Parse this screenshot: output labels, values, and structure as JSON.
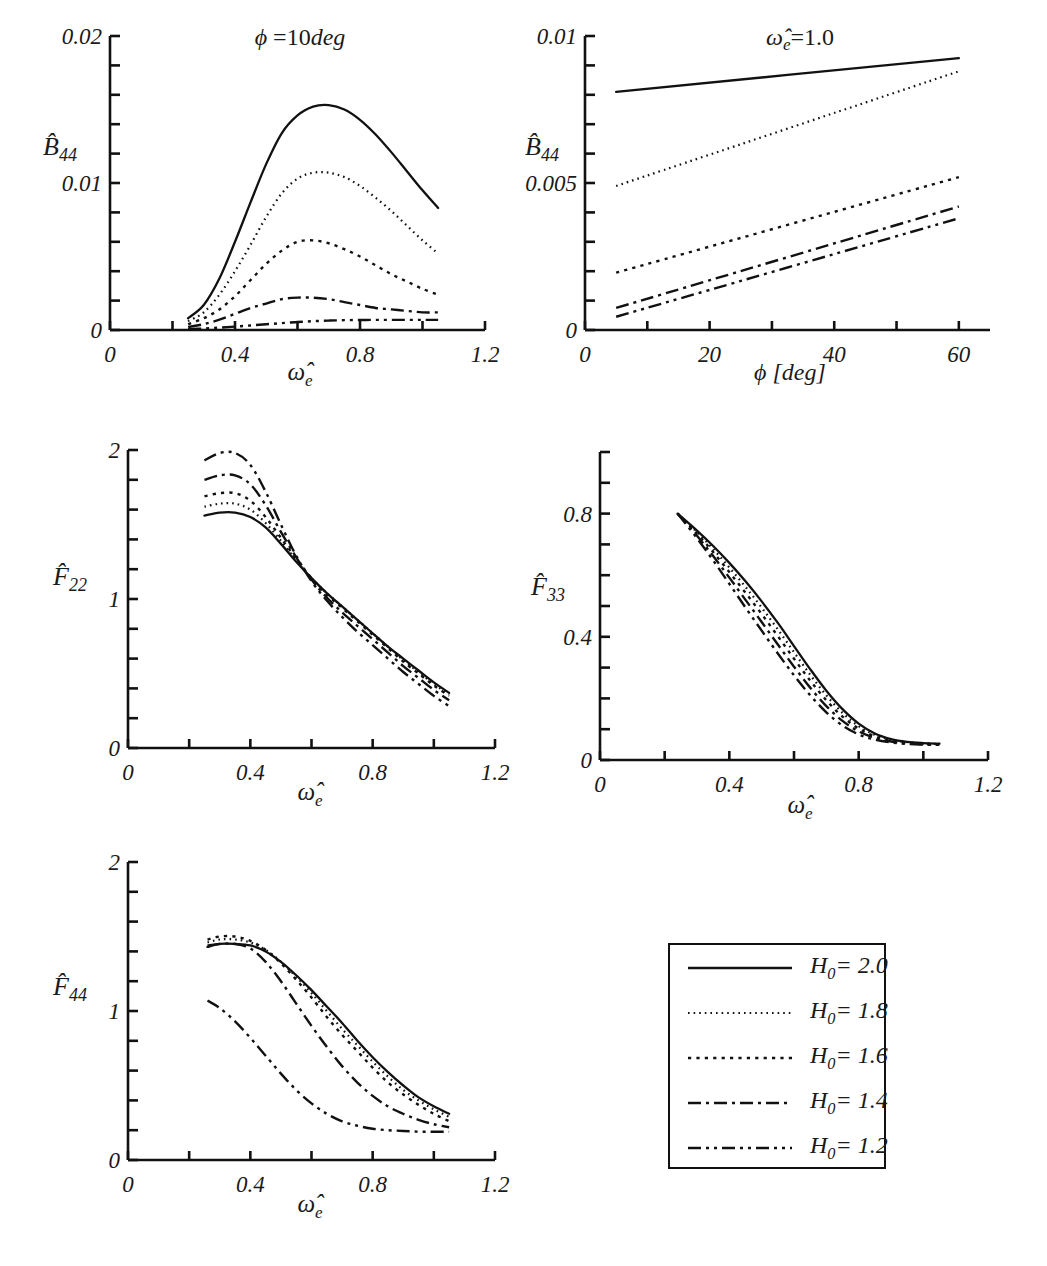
{
  "figure": {
    "background": "#ffffff",
    "line_color": "#111111"
  },
  "legend": {
    "name": "series-legend",
    "entries": [
      {
        "label": "H0= 2.0",
        "style": "solid",
        "value": 2.0
      },
      {
        "label": "H0= 1.8",
        "style": "dotted-fine",
        "value": 1.8
      },
      {
        "label": "H0= 1.6",
        "style": "dotted-coarse",
        "value": 1.6
      },
      {
        "label": "H0= 1.4",
        "style": "dash-dot",
        "value": 1.4
      },
      {
        "label": "H0= 1.2",
        "style": "dash-dot-dot",
        "value": 1.2
      }
    ]
  },
  "chart_data": [
    {
      "id": "plot-b44-vs-omega",
      "type": "line",
      "title": "ϕ =10deg",
      "xlabel": "ω̂e",
      "ylabel": "B̂44",
      "xlim": [
        0,
        1.2
      ],
      "ylim": [
        0,
        0.02
      ],
      "xticks": [
        0,
        0.4,
        0.8,
        1.2
      ],
      "xticklabels": [
        "0",
        "0.4",
        "0.8",
        "1.2"
      ],
      "yticks": [
        0,
        0.01,
        0.02
      ],
      "yticklabels": [
        "0",
        "0.01",
        "0.02"
      ],
      "grid": false,
      "x": [
        0.25,
        0.3,
        0.35,
        0.4,
        0.45,
        0.5,
        0.55,
        0.6,
        0.65,
        0.7,
        0.75,
        0.8,
        0.85,
        0.9,
        0.95,
        1.0,
        1.05
      ],
      "series": [
        {
          "name": "H0= 2.0",
          "style": "solid",
          "values": [
            0.0008,
            0.0017,
            0.0035,
            0.006,
            0.0087,
            0.0113,
            0.0134,
            0.0146,
            0.0152,
            0.0153,
            0.015,
            0.0143,
            0.0133,
            0.0121,
            0.0108,
            0.0095,
            0.0083
          ]
        },
        {
          "name": "H0= 1.8",
          "style": "dotted-fine",
          "values": [
            0.0006,
            0.0012,
            0.0024,
            0.004,
            0.0058,
            0.0077,
            0.0093,
            0.0103,
            0.0107,
            0.0107,
            0.0104,
            0.0098,
            0.009,
            0.0081,
            0.0071,
            0.0061,
            0.0052
          ]
        },
        {
          "name": "H0= 1.6",
          "style": "dotted-coarse",
          "values": [
            0.0004,
            0.0008,
            0.0014,
            0.0023,
            0.0034,
            0.0045,
            0.0054,
            0.006,
            0.0061,
            0.0059,
            0.0055,
            0.005,
            0.0044,
            0.0038,
            0.0033,
            0.0028,
            0.0024
          ]
        },
        {
          "name": "H0= 1.4",
          "style": "dash-dot",
          "values": [
            0.0002,
            0.0004,
            0.0007,
            0.0011,
            0.0015,
            0.0018,
            0.0021,
            0.0022,
            0.0022,
            0.0021,
            0.0019,
            0.0017,
            0.0015,
            0.0014,
            0.0013,
            0.0012,
            0.0012
          ]
        },
        {
          "name": "H0= 1.2",
          "style": "dash-dot-dot",
          "values": [
            5e-05,
            0.0001,
            0.00016,
            0.00023,
            0.00031,
            0.00039,
            0.00047,
            0.00054,
            0.0006,
            0.00064,
            0.00067,
            0.00068,
            0.00069,
            0.00069,
            0.00069,
            0.00069,
            0.00069
          ]
        }
      ]
    },
    {
      "id": "plot-b44-vs-phi",
      "type": "line",
      "title": "ω̂e=1.0",
      "xlabel": "ϕ [deg]",
      "ylabel": "B̂44",
      "xlim": [
        0,
        65
      ],
      "ylim": [
        0,
        0.01
      ],
      "xticks": [
        0,
        10,
        20,
        30,
        40,
        50,
        60
      ],
      "xticklabels": [
        "0",
        "",
        "20",
        "",
        "40",
        "",
        "60"
      ],
      "yticks": [
        0,
        0.005,
        0.01
      ],
      "yticklabels": [
        "0",
        "0.005",
        "0.01"
      ],
      "grid": false,
      "x": [
        5,
        60
      ],
      "series": [
        {
          "name": "H0= 2.0",
          "style": "solid",
          "values": [
            0.0081,
            0.00925
          ]
        },
        {
          "name": "H0= 1.8",
          "style": "dotted-fine",
          "values": [
            0.0049,
            0.0088
          ]
        },
        {
          "name": "H0= 1.6",
          "style": "dotted-coarse",
          "values": [
            0.00195,
            0.0052
          ]
        },
        {
          "name": "H0= 1.4",
          "style": "dash-dot",
          "values": [
            0.00075,
            0.0042
          ]
        },
        {
          "name": "H0= 1.2",
          "style": "dash-dot-dot",
          "values": [
            0.00045,
            0.0038
          ]
        }
      ]
    },
    {
      "id": "plot-f22",
      "type": "line",
      "title": "",
      "xlabel": "ω̂e",
      "ylabel": "F̂22",
      "xlim": [
        0,
        1.2
      ],
      "ylim": [
        0,
        2
      ],
      "xticks": [
        0,
        0.4,
        0.8,
        1.2
      ],
      "xticklabels": [
        "0",
        "0.4",
        "0.8",
        "1.2"
      ],
      "yticks": [
        0,
        1,
        2
      ],
      "yticklabels": [
        "0",
        "1",
        "2"
      ],
      "grid": false,
      "x": [
        0.25,
        0.3,
        0.35,
        0.4,
        0.45,
        0.5,
        0.55,
        0.6,
        0.65,
        0.7,
        0.75,
        0.8,
        0.85,
        0.9,
        0.95,
        1.0,
        1.05
      ],
      "series": [
        {
          "name": "H0= 2.0",
          "style": "solid",
          "values": [
            1.56,
            1.58,
            1.58,
            1.55,
            1.48,
            1.37,
            1.25,
            1.14,
            1.04,
            0.95,
            0.86,
            0.77,
            0.68,
            0.6,
            0.52,
            0.44,
            0.37
          ]
        },
        {
          "name": "H0= 1.8",
          "style": "dotted-fine",
          "values": [
            1.62,
            1.64,
            1.64,
            1.6,
            1.51,
            1.39,
            1.26,
            1.14,
            1.04,
            0.95,
            0.86,
            0.77,
            0.68,
            0.59,
            0.51,
            0.43,
            0.36
          ]
        },
        {
          "name": "H0= 1.6",
          "style": "dotted-coarse",
          "values": [
            1.69,
            1.71,
            1.71,
            1.66,
            1.55,
            1.41,
            1.27,
            1.14,
            1.03,
            0.94,
            0.85,
            0.76,
            0.67,
            0.58,
            0.5,
            0.42,
            0.35
          ]
        },
        {
          "name": "H0= 1.4",
          "style": "dash-dot",
          "values": [
            1.8,
            1.83,
            1.83,
            1.77,
            1.63,
            1.45,
            1.28,
            1.13,
            1.01,
            0.91,
            0.82,
            0.73,
            0.64,
            0.55,
            0.47,
            0.39,
            0.32
          ]
        },
        {
          "name": "H0= 1.2",
          "style": "dash-dot-dot",
          "values": [
            1.93,
            1.98,
            1.98,
            1.9,
            1.72,
            1.5,
            1.29,
            1.12,
            0.99,
            0.88,
            0.78,
            0.69,
            0.6,
            0.51,
            0.43,
            0.35,
            0.28
          ]
        }
      ]
    },
    {
      "id": "plot-f33",
      "type": "line",
      "title": "",
      "xlabel": "ω̂e",
      "ylabel": "F̂33",
      "xlim": [
        0,
        1.2
      ],
      "ylim": [
        0,
        1.0
      ],
      "xticks": [
        0,
        0.4,
        0.8,
        1.2
      ],
      "xticklabels": [
        "0",
        "0.4",
        "0.8",
        "1.2"
      ],
      "yticks": [
        0,
        0.4,
        0.8
      ],
      "yticklabels": [
        "0",
        "0.4",
        "0.8"
      ],
      "grid": false,
      "x": [
        0.24,
        0.3,
        0.35,
        0.4,
        0.45,
        0.5,
        0.55,
        0.6,
        0.65,
        0.7,
        0.75,
        0.8,
        0.85,
        0.9,
        0.95,
        1.0,
        1.05
      ],
      "series": [
        {
          "name": "H0= 2.0",
          "style": "solid",
          "values": [
            0.8,
            0.745,
            0.695,
            0.64,
            0.58,
            0.515,
            0.445,
            0.37,
            0.295,
            0.225,
            0.165,
            0.118,
            0.086,
            0.068,
            0.059,
            0.055,
            0.053
          ]
        },
        {
          "name": "H0= 1.8",
          "style": "dotted-fine",
          "values": [
            0.8,
            0.74,
            0.685,
            0.625,
            0.562,
            0.495,
            0.424,
            0.35,
            0.277,
            0.21,
            0.153,
            0.11,
            0.082,
            0.066,
            0.058,
            0.054,
            0.052
          ]
        },
        {
          "name": "H0= 1.6",
          "style": "dotted-coarse",
          "values": [
            0.8,
            0.735,
            0.675,
            0.61,
            0.543,
            0.474,
            0.402,
            0.329,
            0.258,
            0.194,
            0.141,
            0.102,
            0.077,
            0.063,
            0.056,
            0.053,
            0.051
          ]
        },
        {
          "name": "H0= 1.4",
          "style": "dash-dot",
          "values": [
            0.8,
            0.728,
            0.662,
            0.592,
            0.52,
            0.448,
            0.375,
            0.303,
            0.235,
            0.175,
            0.127,
            0.093,
            0.072,
            0.06,
            0.054,
            0.051,
            0.05
          ]
        },
        {
          "name": "H0= 1.2",
          "style": "dash-dot-dot",
          "values": [
            0.8,
            0.72,
            0.648,
            0.572,
            0.495,
            0.42,
            0.346,
            0.275,
            0.21,
            0.155,
            0.112,
            0.083,
            0.066,
            0.057,
            0.052,
            0.05,
            0.049
          ]
        }
      ]
    },
    {
      "id": "plot-f44",
      "type": "line",
      "title": "",
      "xlabel": "ω̂e",
      "ylabel": "F̂44",
      "xlim": [
        0,
        1.2
      ],
      "ylim": [
        0,
        2
      ],
      "xticks": [
        0,
        0.4,
        0.8,
        1.2
      ],
      "xticklabels": [
        "0",
        "0.4",
        "0.8",
        "1.2"
      ],
      "yticks": [
        0,
        1,
        2
      ],
      "yticklabels": [
        "0",
        "1",
        "2"
      ],
      "grid": false,
      "x": [
        0.26,
        0.3,
        0.35,
        0.4,
        0.45,
        0.5,
        0.55,
        0.6,
        0.65,
        0.7,
        0.75,
        0.8,
        0.85,
        0.9,
        0.95,
        1.0,
        1.05
      ],
      "series": [
        {
          "name": "H0= 2.0",
          "style": "solid",
          "values": [
            1.43,
            1.45,
            1.45,
            1.44,
            1.4,
            1.33,
            1.24,
            1.14,
            1.03,
            0.92,
            0.8,
            0.69,
            0.59,
            0.5,
            0.42,
            0.36,
            0.31
          ]
        },
        {
          "name": "H0= 1.8",
          "style": "dotted-fine",
          "values": [
            1.46,
            1.48,
            1.48,
            1.46,
            1.41,
            1.33,
            1.23,
            1.12,
            1.0,
            0.88,
            0.77,
            0.66,
            0.56,
            0.47,
            0.4,
            0.34,
            0.29
          ]
        },
        {
          "name": "H0= 1.6",
          "style": "dotted-coarse",
          "values": [
            1.48,
            1.5,
            1.5,
            1.47,
            1.41,
            1.32,
            1.21,
            1.09,
            0.96,
            0.84,
            0.73,
            0.62,
            0.52,
            0.44,
            0.37,
            0.31,
            0.26
          ]
        },
        {
          "name": "H0= 1.4",
          "style": "dash-dot",
          "values": [
            1.44,
            1.45,
            1.45,
            1.42,
            1.33,
            1.2,
            1.05,
            0.9,
            0.76,
            0.63,
            0.52,
            0.43,
            0.36,
            0.31,
            0.27,
            0.24,
            0.22
          ]
        },
        {
          "name": "H0= 1.2",
          "style": "dash-dot-dot",
          "values": [
            1.07,
            1.02,
            0.93,
            0.82,
            0.7,
            0.58,
            0.47,
            0.38,
            0.31,
            0.26,
            0.23,
            0.21,
            0.2,
            0.195,
            0.19,
            0.19,
            0.19
          ]
        }
      ]
    }
  ]
}
